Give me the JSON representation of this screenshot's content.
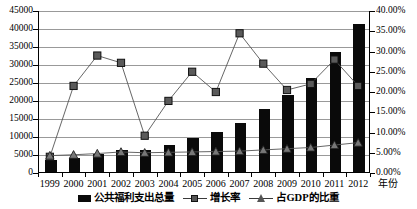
{
  "chart_data": {
    "type": "bar",
    "title": "",
    "xlabel": "年份",
    "ylabel": "",
    "categories": [
      "1999",
      "2000",
      "2001",
      "2002",
      "2003",
      "2004",
      "2005",
      "2006",
      "2007",
      "2008",
      "2009",
      "2010",
      "2011",
      "2012"
    ],
    "y_left": {
      "ticks": [
        "0",
        "5000",
        "10000",
        "15000",
        "20000",
        "25000",
        "30000",
        "35000",
        "40000",
        "45000"
      ],
      "min": 0,
      "max": 45000,
      "step": 5000
    },
    "y_right": {
      "ticks": [
        "0.00%",
        "5.00%",
        "10.00%",
        "15.00%",
        "20.00%",
        "25.00%",
        "30.00%",
        "35.00%",
        "40.00%"
      ],
      "min": 0,
      "max": 40,
      "step": 5
    },
    "grid": true,
    "legend_position": "bottom",
    "series": [
      {
        "name": "公共福利支出总量",
        "type": "bar",
        "axis": "left",
        "marker": "square-solid",
        "color": "#0a0a0a",
        "values": [
          3300,
          3800,
          4900,
          6200,
          6150,
          7600,
          9400,
          11100,
          13700,
          17500,
          21500,
          26100,
          33200,
          41000
        ]
      },
      {
        "name": "增长率",
        "type": "line",
        "axis": "right",
        "marker": "square",
        "color": "#555555",
        "values": [
          4.0,
          21.5,
          29.0,
          27.2,
          9.2,
          17.8,
          25.0,
          20.0,
          34.5,
          27.0,
          20.5,
          22.0,
          28.0,
          21.5
        ]
      },
      {
        "name": "占GDP的比重",
        "type": "line",
        "axis": "right",
        "marker": "triangle",
        "color": "#555555",
        "values": [
          4.3,
          4.5,
          4.8,
          5.2,
          5.0,
          5.1,
          5.2,
          5.3,
          5.4,
          5.7,
          6.0,
          6.3,
          6.9,
          7.5
        ]
      }
    ]
  },
  "legend": {
    "items": [
      {
        "label": "公共福利支出总量",
        "marker": "bar"
      },
      {
        "label": "增长率",
        "marker": "line-square"
      },
      {
        "label": "占GDP的比重",
        "marker": "line-triangle"
      }
    ]
  },
  "axis_titles": {
    "x": "年份"
  }
}
